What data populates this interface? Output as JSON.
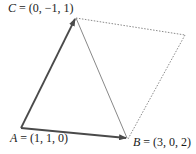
{
  "diagram": {
    "type": "vector parallelogram",
    "points": {
      "A": {
        "name": "A",
        "coords": "(1, 1, 0)",
        "label": "A = (1, 1, 0)"
      },
      "B": {
        "name": "B",
        "coords": "(3, 0, 2)",
        "label": "B = (3, 0, 2)"
      },
      "C": {
        "name": "C",
        "coords": "(0, −1, 1)",
        "label": "C = (0, −1, 1)"
      }
    },
    "labels": {
      "A_name": "A",
      "A_rest": " = (1, 1, 0)",
      "B_name": "B",
      "B_rest": " = (3, 0, 2)",
      "C_name": "C",
      "C_rest": " = (0, −1, 1)"
    },
    "edges": [
      {
        "from": "A",
        "to": "C",
        "style": "solid-arrow"
      },
      {
        "from": "A",
        "to": "B",
        "style": "solid-arrow"
      },
      {
        "from": "C",
        "to": "B",
        "style": "thin-solid"
      },
      {
        "from": "C",
        "to": "D",
        "style": "dotted"
      },
      {
        "from": "D",
        "to": "B",
        "style": "dotted"
      }
    ],
    "colors": {
      "vector": "#4a4a4a",
      "diagonal": "#7a7a7a",
      "dotted": "#8a8a8a",
      "text": "#1a1a1a"
    }
  }
}
